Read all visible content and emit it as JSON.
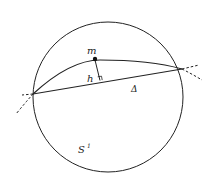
{
  "diagram": {
    "type": "geometry",
    "labels": {
      "point_m": "m",
      "height_h": "h",
      "chord_delta": "Δ",
      "circle": "S¹",
      "circle_superscript": "1"
    },
    "elements": [
      {
        "kind": "circle",
        "name": "S1"
      },
      {
        "kind": "arc",
        "name": "geodesic arc through m"
      },
      {
        "kind": "chord",
        "name": "Δ"
      },
      {
        "kind": "segment",
        "name": "h",
        "note": "perpendicular from m to Δ"
      },
      {
        "kind": "point",
        "name": "m"
      },
      {
        "kind": "dashed-extension",
        "name": "left extension"
      },
      {
        "kind": "dashed-extension",
        "name": "right extension"
      }
    ],
    "colors": {
      "stroke": "#222222",
      "background": "#ffffff"
    }
  }
}
